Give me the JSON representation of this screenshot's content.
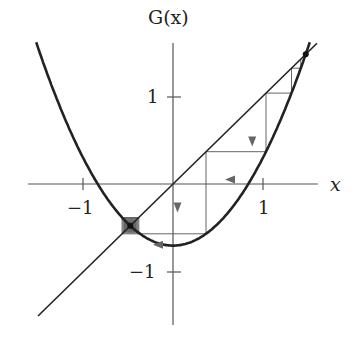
{
  "chart_data": {
    "type": "line",
    "title": "",
    "xlabel": "x",
    "ylabel": "G(x)",
    "x_ticks": [
      {
        "value": -1,
        "label": "−1"
      },
      {
        "value": 1,
        "label": "1"
      }
    ],
    "y_ticks": [
      {
        "value": 1,
        "label": "1"
      },
      {
        "value": -1,
        "label": "−1"
      }
    ],
    "xlim": [
      -1.6,
      1.6
    ],
    "ylim": [
      -1.6,
      1.6
    ],
    "grid": false,
    "function": {
      "name": "G",
      "formula": "x^2 - 0.7",
      "a": 1,
      "c": -0.7,
      "x_range": [
        -1.52,
        1.52
      ]
    },
    "diagonal": {
      "formula": "y = x",
      "x_range": [
        -1.5,
        1.6
      ]
    },
    "fixed_points": [
      {
        "x": -0.475,
        "y": -0.475,
        "marked": true
      },
      {
        "x": 1.475,
        "y": 1.475,
        "marked": true
      }
    ],
    "cobweb": {
      "x0": 1.42,
      "iterations": 60,
      "arrows": [
        {
          "at": "vertical",
          "x": 0.88,
          "direction": "down"
        },
        {
          "at": "horizontal",
          "y": 0.05,
          "direction": "left"
        },
        {
          "at": "vertical",
          "x": 0.05,
          "direction": "down"
        },
        {
          "at": "horizontal",
          "y": -0.69,
          "direction": "left"
        }
      ]
    }
  },
  "labels": {
    "y_axis": "G(x)",
    "x_axis": "x",
    "tick_x_neg1": "−1",
    "tick_x_pos1": "1",
    "tick_y_pos1": "1",
    "tick_y_neg1": "−1"
  }
}
